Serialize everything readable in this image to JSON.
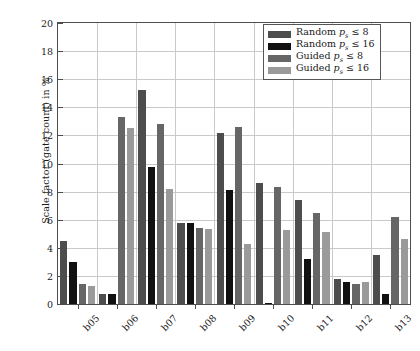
{
  "chart_data": {
    "type": "bar",
    "title": "",
    "xlabel": "",
    "ylabel": "Scale factor (gate count) in %",
    "ylim": [
      0,
      20
    ],
    "yticks": [
      0,
      2,
      4,
      6,
      8,
      10,
      12,
      14,
      16,
      18,
      20
    ],
    "grid": true,
    "legend_position": "top-right",
    "categories": [
      "b05",
      "b06",
      "b07",
      "b08",
      "b09",
      "b10",
      "b11",
      "b12",
      "b13"
    ],
    "series": [
      {
        "name": "Random p_s <= 8",
        "label_prefix": "Random",
        "label_var": "p",
        "label_sub": "s",
        "label_rel": "≤",
        "label_value": "8",
        "color": "#4d4d4d",
        "values": [
          4.5,
          0.7,
          15.2,
          5.8,
          12.2,
          8.6,
          7.4,
          1.8,
          3.5
        ]
      },
      {
        "name": "Random p_s <= 16",
        "label_prefix": "Random",
        "label_var": "p",
        "label_sub": "s",
        "label_rel": "≤",
        "label_value": "16",
        "color": "#111111",
        "values": [
          3.0,
          0.7,
          9.75,
          5.8,
          8.1,
          0.1,
          3.2,
          1.6,
          0.7
        ]
      },
      {
        "name": "Guided p_s <= 8",
        "label_prefix": "Guided",
        "label_var": "p",
        "label_sub": "s",
        "label_rel": "≤",
        "label_value": "8",
        "color": "#666666",
        "values": [
          1.45,
          13.3,
          12.8,
          5.4,
          12.6,
          8.3,
          6.5,
          1.4,
          6.2
        ]
      },
      {
        "name": "Guided p_s <= 16",
        "label_prefix": "Guided",
        "label_var": "p",
        "label_sub": "s",
        "label_rel": "≤",
        "label_value": "16",
        "color": "#9a9a9a",
        "values": [
          1.3,
          12.5,
          8.2,
          5.35,
          4.3,
          5.3,
          5.1,
          1.6,
          4.65
        ]
      }
    ]
  },
  "axis": {
    "y_title": "Scale factor (gate count) in %",
    "y_tick_labels": [
      "0",
      "2",
      "4",
      "6",
      "8",
      "10",
      "12",
      "14",
      "16",
      "18",
      "20"
    ],
    "x_tick_labels": [
      "b05",
      "b06",
      "b07",
      "b08",
      "b09",
      "b10",
      "b11",
      "b12",
      "b13"
    ]
  },
  "legend": {
    "entries": [
      {
        "text": "Random",
        "var": "p",
        "sub": "s",
        "rel": "≤",
        "value": "8",
        "color": "#4d4d4d"
      },
      {
        "text": "Random",
        "var": "p",
        "sub": "s",
        "rel": "≤",
        "value": "16",
        "color": "#111111"
      },
      {
        "text": "Guided",
        "var": "p",
        "sub": "s",
        "rel": "≤",
        "value": "8",
        "color": "#666666"
      },
      {
        "text": "Guided",
        "var": "p",
        "sub": "s",
        "rel": "≤",
        "value": "16",
        "color": "#9a9a9a"
      }
    ]
  }
}
